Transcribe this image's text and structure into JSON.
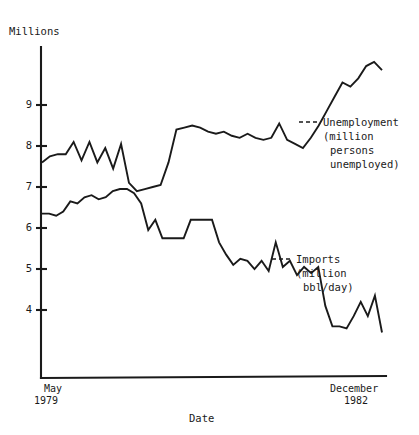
{
  "chart_data": {
    "type": "line",
    "title": "",
    "ylabel": "Millions",
    "xlabel": "Date",
    "grid": false,
    "legend_position": "inline-annotation",
    "yticks": [
      9,
      8,
      7,
      6,
      5,
      4
    ],
    "ytick_labels": [
      "9",
      "8",
      "7",
      "6",
      "5",
      "4"
    ],
    "ylim": [
      3.1,
      10.1
    ],
    "xlim": [
      0,
      43
    ],
    "x_start_label_line1": "May",
    "x_start_label_line2": "1979",
    "x_end_label_line1": "December",
    "x_end_label_line2": "1982",
    "x_note": "Monthly observations from May 1979 through December 1982 (44 points)",
    "series": [
      {
        "name": "Unemployment",
        "annotation_line1": "Unemployment",
        "annotation_line2": "(million",
        "annotation_line3": "persons",
        "annotation_line4": "unemployed)",
        "units": "million persons unemployed",
        "values": [
          7.6,
          7.75,
          7.8,
          7.8,
          8.1,
          7.65,
          8.1,
          7.6,
          7.95,
          7.45,
          8.05,
          7.1,
          6.9,
          6.95,
          7.0,
          7.05,
          7.6,
          8.4,
          8.45,
          8.5,
          8.45,
          8.35,
          8.3,
          8.35,
          8.25,
          8.2,
          8.3,
          8.2,
          8.15,
          8.2,
          8.55,
          8.15,
          8.05,
          7.95,
          8.2,
          8.5,
          8.85,
          9.2,
          9.55,
          9.45,
          9.65,
          9.95,
          10.05,
          9.85
        ]
      },
      {
        "name": "Imports",
        "annotation_line1": "Imports",
        "annotation_line2": "(million",
        "annotation_line3": "bbl/day)",
        "units": "million bbl/day",
        "values": [
          6.35,
          6.35,
          6.3,
          6.4,
          6.65,
          6.6,
          6.75,
          6.8,
          6.7,
          6.75,
          6.9,
          6.95,
          6.95,
          6.85,
          6.6,
          5.95,
          6.2,
          5.75,
          5.75,
          5.75,
          5.75,
          6.2,
          6.2,
          6.2,
          6.2,
          5.65,
          5.35,
          5.1,
          5.25,
          5.2,
          5.0,
          5.2,
          4.95,
          5.65,
          5.05,
          5.2,
          4.85,
          5.05,
          4.9,
          5.05,
          4.1,
          3.6,
          3.6,
          3.55,
          3.85,
          4.2,
          3.85,
          4.35,
          3.45
        ]
      }
    ]
  },
  "annotations": {
    "unemployment": {
      "lines": [
        "Unemployment",
        "(million",
        "persons",
        "unemployed)"
      ],
      "dash": "---"
    },
    "imports": {
      "lines": [
        "Imports",
        "(million",
        "bbl/day)"
      ],
      "dash": "---"
    }
  },
  "axes": {
    "y_axis_title": "Millions",
    "x_axis_title": "Date",
    "y_tick_labels": [
      "9",
      "8",
      "7",
      "6",
      "5",
      "4"
    ],
    "x_left_top": "May",
    "x_left_bottom": "1979",
    "x_right_top": "December",
    "x_right_bottom": "1982"
  },
  "colors": {
    "ink": "#1a1a1a",
    "background": "#ffffff"
  }
}
